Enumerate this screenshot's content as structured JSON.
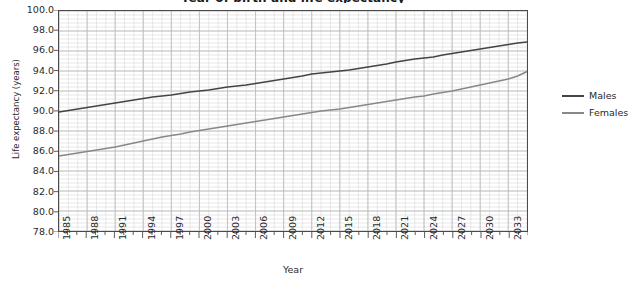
{
  "chart_data": {
    "type": "line",
    "title": "Year of birth and life expectancy",
    "xlabel": "Year",
    "ylabel": "Life expectancy (years)",
    "xlim": [
      1985,
      2035
    ],
    "ylim": [
      78.0,
      100.0
    ],
    "y_ticks": [
      "78.0",
      "80.0",
      "82.0",
      "84.0",
      "86.0",
      "88.0",
      "90.0",
      "92.0",
      "94.0",
      "96.0",
      "98.0",
      "100.0"
    ],
    "y_tick_step": 2.0,
    "x_ticks": [
      "1985",
      "1988",
      "1991",
      "1994",
      "1997",
      "2000",
      "2003",
      "2006",
      "2009",
      "2012",
      "2015",
      "2018",
      "2021",
      "2024",
      "2027",
      "2030",
      "2033"
    ],
    "x_tick_step": 3,
    "grid": true,
    "grid_minor": true,
    "legend_position": "right",
    "x": [
      1985,
      1986,
      1987,
      1988,
      1989,
      1990,
      1991,
      1992,
      1993,
      1994,
      1995,
      1996,
      1997,
      1998,
      1999,
      2000,
      2001,
      2002,
      2003,
      2004,
      2005,
      2006,
      2007,
      2008,
      2009,
      2010,
      2011,
      2012,
      2013,
      2014,
      2015,
      2016,
      2017,
      2018,
      2019,
      2020,
      2021,
      2022,
      2023,
      2024,
      2025,
      2026,
      2027,
      2028,
      2029,
      2030,
      2031,
      2032,
      2033,
      2034,
      2035
    ],
    "series": [
      {
        "name": "Males",
        "color": "#444444",
        "values": [
          89.9,
          90.05,
          90.2,
          90.35,
          90.5,
          90.65,
          90.8,
          90.95,
          91.1,
          91.25,
          91.4,
          91.5,
          91.6,
          91.75,
          91.9,
          92.0,
          92.1,
          92.25,
          92.4,
          92.5,
          92.6,
          92.75,
          92.9,
          93.05,
          93.2,
          93.35,
          93.5,
          93.7,
          93.8,
          93.9,
          94.0,
          94.1,
          94.25,
          94.4,
          94.55,
          94.7,
          94.9,
          95.05,
          95.2,
          95.3,
          95.4,
          95.6,
          95.75,
          95.9,
          96.05,
          96.2,
          96.35,
          96.5,
          96.65,
          96.8,
          96.9
        ]
      },
      {
        "name": "Females",
        "color": "#888888",
        "values": [
          85.5,
          85.65,
          85.8,
          85.95,
          86.1,
          86.25,
          86.4,
          86.6,
          86.8,
          87.0,
          87.2,
          87.4,
          87.55,
          87.7,
          87.9,
          88.05,
          88.2,
          88.35,
          88.5,
          88.65,
          88.8,
          88.95,
          89.1,
          89.25,
          89.4,
          89.55,
          89.7,
          89.85,
          90.0,
          90.1,
          90.2,
          90.35,
          90.5,
          90.65,
          90.8,
          90.95,
          91.1,
          91.25,
          91.4,
          91.5,
          91.7,
          91.85,
          92.0,
          92.2,
          92.4,
          92.6,
          92.8,
          93.0,
          93.2,
          93.5,
          93.95
        ]
      }
    ]
  }
}
